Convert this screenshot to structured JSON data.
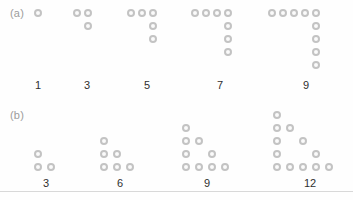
{
  "figure": {
    "background_color": "#fefefe",
    "dot_fill_color": "#fbfbfb",
    "dot_ring_color": "#c3c3c3",
    "label_color": "#9c9c9c",
    "number_color": "#2f2f2f",
    "rule_color": "#d8d8d8"
  },
  "panels": [
    {
      "id": "a",
      "label": "(a)",
      "label_x": 10,
      "label_y": 8,
      "number_y": 80,
      "description": "L-shaped gnomon dot arrays representing consecutive odd numbers",
      "groups": [
        {
          "count_label": "1",
          "count_value": 1,
          "label_x": 38,
          "dots": [
            [
              38,
              13
            ]
          ]
        },
        {
          "count_label": "3",
          "count_value": 3,
          "label_x": 87,
          "dots": [
            [
              77,
              13
            ],
            [
              88,
              13
            ],
            [
              88,
              26
            ]
          ]
        },
        {
          "count_label": "5",
          "count_value": 5,
          "label_x": 147,
          "dots": [
            [
              131,
              13
            ],
            [
              142,
              13
            ],
            [
              153,
              13
            ],
            [
              153,
              26
            ],
            [
              153,
              39
            ]
          ]
        },
        {
          "count_label": "7",
          "count_value": 7,
          "label_x": 220,
          "dots": [
            [
              195,
              13
            ],
            [
              206,
              13
            ],
            [
              217,
              13
            ],
            [
              228,
              13
            ],
            [
              228,
              26
            ],
            [
              228,
              39
            ],
            [
              228,
              52
            ]
          ]
        },
        {
          "count_label": "9",
          "count_value": 9,
          "label_x": 306,
          "dots": [
            [
              272,
              13
            ],
            [
              283,
              13
            ],
            [
              294,
              13
            ],
            [
              305,
              13
            ],
            [
              316,
              13
            ],
            [
              316,
              26
            ],
            [
              316,
              39
            ],
            [
              316,
              52
            ],
            [
              316,
              65
            ]
          ]
        }
      ]
    },
    {
      "id": "b",
      "label": "(b)",
      "label_x": 10,
      "label_y": 110,
      "number_y": 178,
      "description": "Right-triangular dot arrays representing multiples of three",
      "groups": [
        {
          "count_label": "3",
          "count_value": 3,
          "label_x": 46,
          "dots": [
            [
              38,
              154
            ],
            [
              38,
              167
            ],
            [
              51,
              167
            ]
          ]
        },
        {
          "count_label": "6",
          "count_value": 6,
          "label_x": 120,
          "dots": [
            [
              104,
              141
            ],
            [
              104,
              154
            ],
            [
              117,
              154
            ],
            [
              104,
              167
            ],
            [
              117,
              167
            ],
            [
              130,
              167
            ]
          ]
        },
        {
          "count_label": "9",
          "count_value": 9,
          "label_x": 207,
          "dots": [
            [
              186,
              128
            ],
            [
              186,
              141
            ],
            [
              199,
              141
            ],
            [
              186,
              154
            ],
            [
              212,
              154
            ],
            [
              186,
              167
            ],
            [
              199,
              167
            ],
            [
              212,
              167
            ],
            [
              225,
              167
            ]
          ]
        },
        {
          "count_label": "12",
          "count_value": 12,
          "label_x": 310,
          "dots": [
            [
              277,
              115
            ],
            [
              277,
              128
            ],
            [
              290,
              128
            ],
            [
              277,
              141
            ],
            [
              303,
              141
            ],
            [
              277,
              154
            ],
            [
              316,
              154
            ],
            [
              277,
              167
            ],
            [
              290,
              167
            ],
            [
              303,
              167
            ],
            [
              316,
              167
            ],
            [
              329,
              167
            ]
          ]
        }
      ]
    }
  ]
}
